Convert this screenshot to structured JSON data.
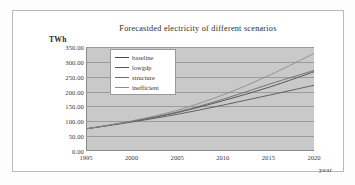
{
  "figure": {
    "title": "Forecastded electricity of different scenarios",
    "y_unit": "TWh",
    "x_axis_label": "year"
  },
  "chart_data": {
    "type": "line",
    "title": "Forecastded electricity of different scenarios",
    "xlabel": "year",
    "ylabel": "TWh",
    "xlim": [
      1995,
      2020
    ],
    "ylim": [
      0,
      350
    ],
    "xticks": [
      "1995",
      "2000",
      "2005",
      "2010",
      "2015",
      "2020"
    ],
    "yticks": [
      "0.00",
      "50.00",
      "100.00",
      "150.00",
      "200.00",
      "250.00",
      "300.00",
      "350.00"
    ],
    "grid": "horizontal",
    "legend_position": "upper-left-inside",
    "plot_background": "#c9c9c9",
    "x": [
      1995,
      2000,
      2005,
      2010,
      2015,
      2020
    ],
    "series": [
      {
        "name": "baseline",
        "color": "#4a4a4a",
        "values": [
          75,
          100,
          130,
          170,
          215,
          268
        ]
      },
      {
        "name": "lowgdp",
        "color": "#555555",
        "values": [
          75,
          98,
          124,
          155,
          188,
          222
        ]
      },
      {
        "name": "structure",
        "color": "#6b6b6b",
        "values": [
          75,
          100,
          132,
          175,
          225,
          272
        ]
      },
      {
        "name": "inefficient",
        "color": "#8c8c8c",
        "values": [
          75,
          102,
          138,
          190,
          255,
          330
        ]
      }
    ]
  }
}
